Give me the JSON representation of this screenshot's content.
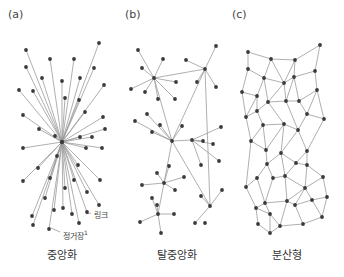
{
  "panels": [
    {
      "tag": "(a)",
      "caption": "중앙화"
    },
    {
      "tag": "(b)",
      "caption": "탈중앙화"
    },
    {
      "tag": "(c)",
      "caption": "분산형"
    }
  ],
  "annotations": {
    "link": "링크",
    "node": "정거장",
    "node_sup": "1"
  },
  "colors": {
    "node": "#3a3a3a",
    "edge": "#9a9a9a",
    "text": "#333333"
  },
  "networks": {
    "a": {
      "hub": [
        62,
        142
      ],
      "nodes": [
        [
          26,
          50
        ],
        [
          99,
          43
        ],
        [
          50,
          59
        ],
        [
          74,
          59
        ],
        [
          26,
          67
        ],
        [
          94,
          68
        ],
        [
          42,
          78
        ],
        [
          80,
          78
        ],
        [
          62,
          81
        ],
        [
          19,
          90
        ],
        [
          33,
          91
        ],
        [
          104,
          85
        ],
        [
          65,
          98
        ],
        [
          79,
          100
        ],
        [
          23,
          115
        ],
        [
          85,
          112
        ],
        [
          103,
          117
        ],
        [
          39,
          129
        ],
        [
          105,
          129
        ],
        [
          55,
          136
        ],
        [
          80,
          137
        ],
        [
          92,
          137
        ],
        [
          23,
          148
        ],
        [
          102,
          148
        ],
        [
          57,
          156
        ],
        [
          86,
          148
        ],
        [
          38,
          168
        ],
        [
          78,
          165
        ],
        [
          50,
          178
        ],
        [
          74,
          180
        ],
        [
          23,
          181
        ],
        [
          100,
          180
        ],
        [
          65,
          188
        ],
        [
          87,
          192
        ],
        [
          45,
          198
        ],
        [
          54,
          210
        ],
        [
          99,
          205
        ],
        [
          72,
          214
        ],
        [
          32,
          216
        ],
        [
          87,
          212
        ],
        [
          63,
          208
        ],
        [
          79,
          223
        ],
        [
          49,
          229
        ],
        [
          33,
          225
        ]
      ],
      "link_label_pos": [
        90,
        213
      ],
      "node_label_pos": [
        60,
        232
      ]
    },
    "b": {
      "edges": [
        [
          0,
          2
        ],
        [
          1,
          2
        ],
        [
          3,
          2
        ],
        [
          4,
          2
        ],
        [
          5,
          2
        ],
        [
          6,
          2
        ],
        [
          7,
          2
        ],
        [
          8,
          2
        ],
        [
          2,
          9
        ],
        [
          10,
          9
        ],
        [
          11,
          9
        ],
        [
          12,
          9
        ],
        [
          13,
          9
        ],
        [
          9,
          14
        ],
        [
          2,
          14
        ],
        [
          15,
          14
        ],
        [
          16,
          14
        ],
        [
          17,
          14
        ],
        [
          18,
          14
        ],
        [
          19,
          14
        ],
        [
          20,
          21
        ],
        [
          22,
          21
        ],
        [
          23,
          21
        ],
        [
          24,
          21
        ],
        [
          25,
          21
        ],
        [
          14,
          21
        ],
        [
          26,
          27
        ],
        [
          28,
          27
        ],
        [
          29,
          27
        ],
        [
          30,
          27
        ],
        [
          31,
          27
        ],
        [
          14,
          27
        ],
        [
          32,
          33
        ],
        [
          34,
          33
        ],
        [
          35,
          33
        ],
        [
          36,
          33
        ],
        [
          37,
          33
        ],
        [
          27,
          33
        ],
        [
          14,
          38
        ],
        [
          39,
          38
        ],
        [
          40,
          38
        ],
        [
          41,
          38
        ],
        [
          9,
          38
        ]
      ],
      "nodes": [
        [
          138,
          50
        ],
        [
          163,
          59
        ],
        [
          154,
          78
        ],
        [
          142,
          68
        ],
        [
          131,
          89
        ],
        [
          145,
          92
        ],
        [
          158,
          99
        ],
        [
          176,
          82
        ],
        [
          175,
          99
        ],
        [
          205,
          69
        ],
        [
          186,
          60
        ],
        [
          216,
          46
        ],
        [
          197,
          82
        ],
        [
          216,
          87
        ],
        [
          172,
          141
        ],
        [
          147,
          114
        ],
        [
          135,
          121
        ],
        [
          152,
          132
        ],
        [
          160,
          125
        ],
        [
          182,
          126
        ],
        [
          203,
          141
        ],
        [
          192,
          140
        ],
        [
          213,
          144
        ],
        [
          219,
          161
        ],
        [
          201,
          165
        ],
        [
          221,
          127
        ],
        [
          169,
          166
        ],
        [
          164,
          183
        ],
        [
          157,
          173
        ],
        [
          142,
          185
        ],
        [
          184,
          177
        ],
        [
          175,
          190
        ],
        [
          157,
          205
        ],
        [
          158,
          214
        ],
        [
          152,
          198
        ],
        [
          140,
          222
        ],
        [
          174,
          214
        ],
        [
          161,
          233
        ],
        [
          210,
          206
        ],
        [
          201,
          196
        ],
        [
          222,
          190
        ],
        [
          195,
          223
        ],
        [
          205,
          223
        ]
      ],
      "hub_edges_note": "star clusters connected through central hub"
    },
    "c": {
      "nodes": [
        [
          248,
          52
        ],
        [
          320,
          45
        ],
        [
          271,
          59
        ],
        [
          295,
          60
        ],
        [
          248,
          69
        ],
        [
          315,
          71
        ],
        [
          264,
          78
        ],
        [
          294,
          77
        ],
        [
          284,
          83
        ],
        [
          242,
          92
        ],
        [
          257,
          96
        ],
        [
          317,
          90
        ],
        [
          268,
          102
        ],
        [
          286,
          101
        ],
        [
          299,
          101
        ],
        [
          246,
          117
        ],
        [
          257,
          111
        ],
        [
          307,
          114
        ],
        [
          263,
          125
        ],
        [
          284,
          124
        ],
        [
          324,
          119
        ],
        [
          298,
          130
        ],
        [
          251,
          141
        ],
        [
          266,
          150
        ],
        [
          307,
          151
        ],
        [
          267,
          164
        ],
        [
          281,
          153
        ],
        [
          296,
          163
        ],
        [
          273,
          178
        ],
        [
          285,
          176
        ],
        [
          307,
          165
        ],
        [
          246,
          187
        ],
        [
          257,
          178
        ],
        [
          323,
          177
        ],
        [
          265,
          203
        ],
        [
          287,
          201
        ],
        [
          305,
          188
        ],
        [
          295,
          205
        ],
        [
          256,
          208
        ],
        [
          270,
          214
        ],
        [
          312,
          200
        ],
        [
          327,
          197
        ],
        [
          322,
          217
        ],
        [
          280,
          226
        ],
        [
          303,
          224
        ],
        [
          258,
          224
        ],
        [
          270,
          233
        ]
      ],
      "edges": [
        [
          0,
          2
        ],
        [
          2,
          3
        ],
        [
          3,
          1
        ],
        [
          0,
          4
        ],
        [
          2,
          6
        ],
        [
          2,
          8
        ],
        [
          3,
          8
        ],
        [
          3,
          7
        ],
        [
          1,
          5
        ],
        [
          4,
          6
        ],
        [
          4,
          9
        ],
        [
          6,
          8
        ],
        [
          8,
          7
        ],
        [
          7,
          5
        ],
        [
          5,
          11
        ],
        [
          9,
          10
        ],
        [
          6,
          10
        ],
        [
          6,
          12
        ],
        [
          8,
          12
        ],
        [
          8,
          13
        ],
        [
          7,
          13
        ],
        [
          7,
          14
        ],
        [
          11,
          14
        ],
        [
          9,
          15
        ],
        [
          10,
          16
        ],
        [
          10,
          15
        ],
        [
          12,
          16
        ],
        [
          12,
          13
        ],
        [
          13,
          14
        ],
        [
          14,
          17
        ],
        [
          11,
          17
        ],
        [
          11,
          20
        ],
        [
          15,
          16
        ],
        [
          16,
          18
        ],
        [
          12,
          19
        ],
        [
          18,
          19
        ],
        [
          19,
          21
        ],
        [
          13,
          21
        ],
        [
          17,
          21
        ],
        [
          17,
          20
        ],
        [
          20,
          24
        ],
        [
          15,
          22
        ],
        [
          18,
          22
        ],
        [
          18,
          23
        ],
        [
          19,
          23
        ],
        [
          19,
          26
        ],
        [
          21,
          26
        ],
        [
          21,
          24
        ],
        [
          22,
          23
        ],
        [
          23,
          25
        ],
        [
          25,
          26
        ],
        [
          26,
          27
        ],
        [
          24,
          27
        ],
        [
          24,
          30
        ],
        [
          22,
          31
        ],
        [
          25,
          32
        ],
        [
          31,
          32
        ],
        [
          25,
          28
        ],
        [
          28,
          29
        ],
        [
          26,
          29
        ],
        [
          27,
          29
        ],
        [
          27,
          30
        ],
        [
          30,
          33
        ],
        [
          30,
          36
        ],
        [
          33,
          36
        ],
        [
          29,
          36
        ],
        [
          28,
          34
        ],
        [
          32,
          34
        ],
        [
          31,
          38
        ],
        [
          34,
          38
        ],
        [
          34,
          35
        ],
        [
          29,
          35
        ],
        [
          35,
          36
        ],
        [
          35,
          37
        ],
        [
          36,
          37
        ],
        [
          36,
          40
        ],
        [
          33,
          41
        ],
        [
          40,
          41
        ],
        [
          37,
          40
        ],
        [
          40,
          42
        ],
        [
          41,
          42
        ],
        [
          38,
          39
        ],
        [
          34,
          39
        ],
        [
          39,
          43
        ],
        [
          35,
          43
        ],
        [
          37,
          44
        ],
        [
          43,
          44
        ],
        [
          42,
          44
        ],
        [
          38,
          45
        ],
        [
          45,
          46
        ],
        [
          39,
          46
        ],
        [
          46,
          43
        ]
      ]
    }
  }
}
